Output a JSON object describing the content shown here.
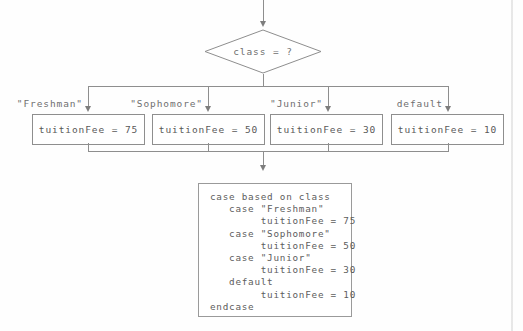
{
  "diagram": {
    "type": "flowchart",
    "decision": {
      "label": "class = ?"
    },
    "branches": [
      {
        "label": "\"Freshman\"",
        "action": "tuitionFee = 75"
      },
      {
        "label": "\"Sophomore\"",
        "action": "tuitionFee = 50"
      },
      {
        "label": "\"Junior\"",
        "action": "tuitionFee = 30"
      },
      {
        "label": "default",
        "action": "tuitionFee = 10"
      }
    ]
  },
  "pseudocode": {
    "text": "case based on class\n   case \"Freshman\"\n        tuitionFee = 75\n   case \"Sophomore\"\n        tuitionFee = 50\n   case \"Junior\"\n        tuitionFee = 30\n   default\n        tuitionFee = 10\nendcase"
  },
  "colors": {
    "stroke": "#8e8e8e",
    "text": "#5d5d5d",
    "background": "#fefefe"
  }
}
